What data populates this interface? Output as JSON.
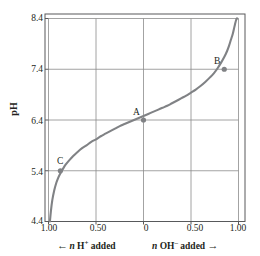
{
  "chart_data": {
    "type": "line",
    "title": "",
    "subtitle": "",
    "xlabel_left": "n H+ added",
    "xlabel_right": "n OH- added",
    "ylabel": "pH",
    "xlim": [
      -1.0,
      1.0
    ],
    "ylim": [
      4.4,
      8.4
    ],
    "grid": true,
    "legend": "none",
    "x_tick_labels": [
      "1.00",
      "0.50",
      "0",
      "0.50",
      "1.00"
    ],
    "x_tick_values": [
      -1.0,
      -0.5,
      0,
      0.5,
      1.0
    ],
    "y_tick_labels": [
      "8.4",
      "7.4",
      "6.4",
      "5.4",
      "4.4"
    ],
    "y_tick_values": [
      8.4,
      7.4,
      6.4,
      5.4,
      4.4
    ],
    "series": [
      {
        "name": "titration-curve",
        "color": "#808285",
        "x": [
          -0.985,
          -0.975,
          -0.96,
          -0.94,
          -0.92,
          -0.9,
          -0.88,
          -0.85,
          -0.82,
          -0.78,
          -0.74,
          -0.7,
          -0.65,
          -0.6,
          -0.55,
          -0.5,
          -0.45,
          -0.4,
          -0.35,
          -0.3,
          -0.25,
          -0.2,
          -0.15,
          -0.1,
          -0.05,
          0.0,
          0.05,
          0.1,
          0.15,
          0.2,
          0.25,
          0.3,
          0.35,
          0.4,
          0.45,
          0.5,
          0.55,
          0.6,
          0.65,
          0.7,
          0.74,
          0.78,
          0.82,
          0.85,
          0.88,
          0.9,
          0.92,
          0.94,
          0.955,
          0.965,
          0.975,
          0.982,
          0.988
        ],
        "y": [
          4.4,
          4.6,
          4.82,
          5.01,
          5.15,
          5.25,
          5.33,
          5.43,
          5.52,
          5.61,
          5.69,
          5.76,
          5.84,
          5.9,
          5.97,
          6.02,
          6.08,
          6.13,
          6.18,
          6.23,
          6.28,
          6.32,
          6.36,
          6.4,
          6.44,
          6.48,
          6.52,
          6.56,
          6.6,
          6.64,
          6.68,
          6.73,
          6.78,
          6.83,
          6.88,
          6.94,
          7.0,
          7.07,
          7.15,
          7.24,
          7.32,
          7.42,
          7.54,
          7.64,
          7.76,
          7.86,
          7.98,
          8.1,
          8.22,
          8.3,
          8.37,
          8.4,
          8.4
        ]
      }
    ],
    "annotations": [
      {
        "label": "A",
        "x": 0.0,
        "y": 6.4,
        "marker": true
      },
      {
        "label": "B",
        "x": 0.85,
        "y": 7.4,
        "marker": true
      },
      {
        "label": "C",
        "x": -0.875,
        "y": 5.4,
        "marker": true
      }
    ]
  },
  "axis": {
    "y_title": "pH",
    "x_left_caption_n": "n",
    "x_left_caption_species": "H",
    "x_left_caption_charge": "+",
    "x_left_caption_verb": "added",
    "x_right_caption_n": "n",
    "x_right_caption_species": "OH",
    "x_right_caption_charge": "–",
    "x_right_caption_verb": "added",
    "arrow_left": "←",
    "arrow_right": "→"
  },
  "colors": {
    "curve": "#808285",
    "grid": "#8c8c8c",
    "frame": "#58595b",
    "text": "#231f20",
    "background": "#ffffff"
  }
}
